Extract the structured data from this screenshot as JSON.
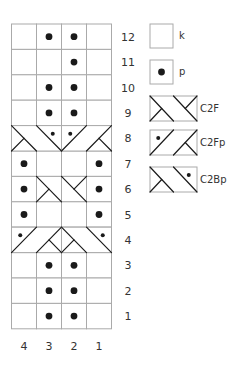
{
  "chart_data": {
    "type": "knitting-chart",
    "columns": 4,
    "rows": 12,
    "column_labels": [
      "4",
      "3",
      "2",
      "1"
    ],
    "row_labels": [
      "12",
      "11",
      "10",
      "9",
      "8",
      "7",
      "6",
      "5",
      "4",
      "3",
      "2",
      "1"
    ],
    "grid": {
      "12": [
        "k",
        "p",
        "p",
        "k"
      ],
      "11": [
        "k",
        "k",
        "p",
        "k"
      ],
      "10": [
        "k",
        "p",
        "p",
        "k"
      ],
      "9": [
        "k",
        "p",
        "p",
        "k"
      ],
      "8": [
        "C2Bp",
        "C2Bp",
        "C2Fp",
        "C2Fp"
      ],
      "7": [
        "p",
        "k",
        "k",
        "p"
      ],
      "6": [
        "p",
        "C2F",
        "C2F",
        "p"
      ],
      "5": [
        "p",
        "k",
        "k",
        "p"
      ],
      "4": [
        "C2Fp",
        "C2Fp",
        "C2Bp",
        "C2Bp"
      ],
      "3": [
        "k",
        "p",
        "p",
        "k"
      ],
      "2": [
        "k",
        "p",
        "p",
        "k"
      ],
      "1": [
        "k",
        "p",
        "p",
        "k"
      ]
    },
    "cables": [
      {
        "row": 8,
        "cols": [
          4,
          3
        ],
        "symbol": "C2Bp"
      },
      {
        "row": 8,
        "cols": [
          2,
          1
        ],
        "symbol": "C2Fp"
      },
      {
        "row": 6,
        "cols": [
          3,
          2
        ],
        "symbol": "C2F"
      },
      {
        "row": 4,
        "cols": [
          4,
          3
        ],
        "symbol": "C2Fp"
      },
      {
        "row": 4,
        "cols": [
          2,
          1
        ],
        "symbol": "C2Bp"
      }
    ]
  },
  "legend": [
    {
      "symbol": "k",
      "label": "k"
    },
    {
      "symbol": "p",
      "label": "p"
    },
    {
      "symbol": "C2F",
      "label": "C2F"
    },
    {
      "symbol": "C2Fp",
      "label": "C2Fp"
    },
    {
      "symbol": "C2Bp",
      "label": "C2Bp"
    }
  ],
  "colors": {
    "grid_line": "#aaaaaa",
    "symbol": "#1a1a1a",
    "text": "#333333"
  }
}
